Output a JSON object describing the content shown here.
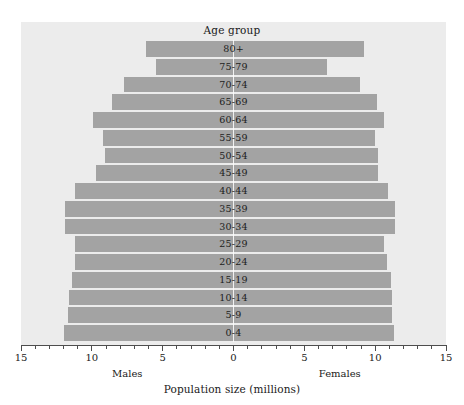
{
  "chart_data": {
    "type": "bar",
    "subtype": "population-pyramid",
    "title": "Age group",
    "xlabel": "Population size (millions)",
    "ylabel": "",
    "orientation": "horizontal",
    "grid": false,
    "legend_position": "below-axis",
    "xlim": [
      -15,
      15
    ],
    "axis_display": "mirrored",
    "xticks": [
      15,
      10,
      5,
      0,
      5,
      10,
      15
    ],
    "xtick_labels": [
      "15",
      "10",
      "5",
      "0",
      "5",
      "10",
      "15"
    ],
    "minor_tick_step": 1,
    "categories": [
      "80+",
      "75-79",
      "70-74",
      "65-69",
      "60-64",
      "55-59",
      "50-54",
      "45-49",
      "40-44",
      "35-39",
      "30-34",
      "25-29",
      "20-24",
      "15-19",
      "10-14",
      "5-9",
      "0-4"
    ],
    "series": [
      {
        "name": "Males",
        "side": "left",
        "values": [
          6.2,
          5.5,
          7.7,
          8.6,
          9.9,
          9.2,
          9.1,
          9.7,
          11.2,
          11.9,
          11.9,
          11.2,
          11.2,
          11.4,
          11.6,
          11.7,
          12.0
        ]
      },
      {
        "name": "Females",
        "side": "right",
        "values": [
          9.2,
          6.6,
          8.9,
          10.1,
          10.6,
          10.0,
          10.2,
          10.2,
          10.9,
          11.4,
          11.4,
          10.6,
          10.8,
          11.1,
          11.2,
          11.2,
          11.3
        ]
      }
    ],
    "colors": {
      "bar": "#a3a3a3",
      "panel_background": "#ececec",
      "page_background": "#ffffff",
      "axis": "#4d4d4d",
      "text": "#1a1a1a",
      "separator": "#ffffff"
    }
  },
  "labels": {
    "title": "Age group",
    "axis_title": "Population size (millions)",
    "males": "Males",
    "females": "Females"
  }
}
